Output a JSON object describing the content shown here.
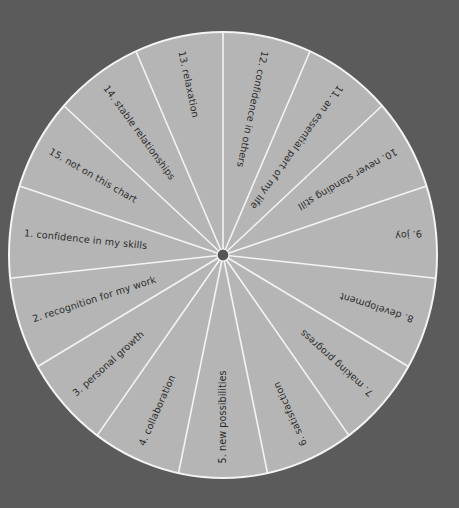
{
  "wheel": {
    "center": [
      223,
      255
    ],
    "rx": 214,
    "ry": 223,
    "segment_count": 15,
    "first_divider_angle_deg": 90,
    "label_start_radius": 200,
    "colors": {
      "background": "#5b5b5b",
      "segment_fill": "#b5b5b5",
      "divider": "#f4f4f4",
      "hub": "#555555",
      "text": "#2c2c2c"
    },
    "segments": [
      {
        "number": "1.",
        "label": "confidence in my skills",
        "mid_angle_deg": 174
      },
      {
        "number": "2.",
        "label": "recognition for my work",
        "mid_angle_deg": 198
      },
      {
        "number": "3.",
        "label": "personal growth",
        "mid_angle_deg": 222
      },
      {
        "number": "4.",
        "label": "collaboration",
        "mid_angle_deg": 246
      },
      {
        "number": "5.",
        "label": "new possibilities",
        "mid_angle_deg": 270
      },
      {
        "number": "6.",
        "label": "satisfaction",
        "mid_angle_deg": 294
      },
      {
        "number": "7.",
        "label": "making progress",
        "mid_angle_deg": 318
      },
      {
        "number": "8.",
        "label": "development",
        "mid_angle_deg": 342
      },
      {
        "number": "9.",
        "label": "joy",
        "mid_angle_deg": 6
      },
      {
        "number": "10.",
        "label": "never standing still",
        "mid_angle_deg": 30
      },
      {
        "number": "11.",
        "label": "an essential part of my life",
        "mid_angle_deg": 54
      },
      {
        "number": "12.",
        "label": "confidence in others",
        "mid_angle_deg": 78
      },
      {
        "number": "13.",
        "label": "relaxation",
        "mid_angle_deg": 102
      },
      {
        "number": "14.",
        "label": "stable relationships",
        "mid_angle_deg": 126
      },
      {
        "number": "15.",
        "label": "not on this chart",
        "mid_angle_deg": 150
      }
    ]
  }
}
